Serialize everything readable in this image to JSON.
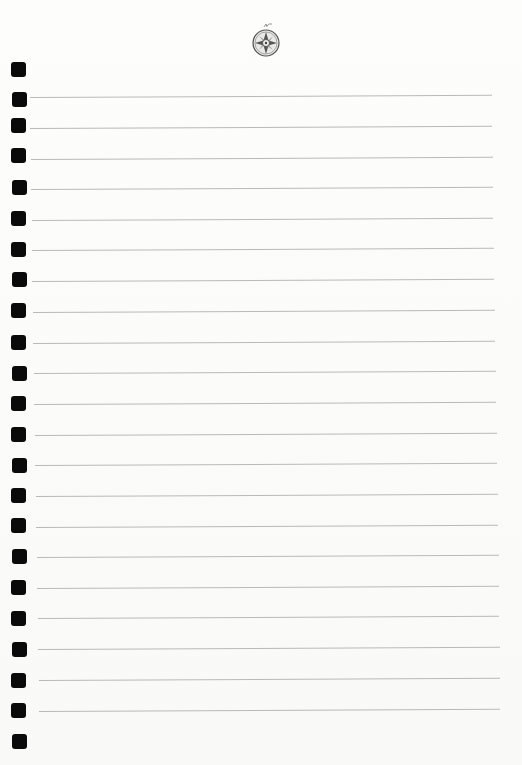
{
  "page": {
    "type": "lined-notebook-page",
    "background_color": "#fbfbfa",
    "rule_color": "#b9b9b6",
    "hole_color": "#0a0a0a",
    "emblem": "compass-rose-icon"
  },
  "holes_y": [
    62,
    92,
    118,
    148,
    180,
    211,
    242,
    272,
    303,
    335,
    366,
    396,
    427,
    458,
    488,
    518,
    549,
    580,
    611,
    642,
    673,
    703,
    734
  ],
  "rules": [
    {
      "y": 97,
      "x1": 30,
      "x2": 492
    },
    {
      "y": 128,
      "x1": 30,
      "x2": 492
    },
    {
      "y": 159,
      "x1": 31,
      "x2": 493
    },
    {
      "y": 189,
      "x1": 31,
      "x2": 493
    },
    {
      "y": 220,
      "x1": 32,
      "x2": 493
    },
    {
      "y": 250,
      "x1": 32,
      "x2": 494
    },
    {
      "y": 281,
      "x1": 32,
      "x2": 494
    },
    {
      "y": 312,
      "x1": 33,
      "x2": 495
    },
    {
      "y": 343,
      "x1": 33,
      "x2": 495
    },
    {
      "y": 373,
      "x1": 34,
      "x2": 496
    },
    {
      "y": 404,
      "x1": 34,
      "x2": 496
    },
    {
      "y": 435,
      "x1": 35,
      "x2": 497
    },
    {
      "y": 465,
      "x1": 35,
      "x2": 497
    },
    {
      "y": 496,
      "x1": 36,
      "x2": 498
    },
    {
      "y": 527,
      "x1": 36,
      "x2": 498
    },
    {
      "y": 557,
      "x1": 37,
      "x2": 499
    },
    {
      "y": 588,
      "x1": 37,
      "x2": 499
    },
    {
      "y": 618,
      "x1": 38,
      "x2": 499
    },
    {
      "y": 649,
      "x1": 38,
      "x2": 500
    },
    {
      "y": 680,
      "x1": 39,
      "x2": 500
    },
    {
      "y": 711,
      "x1": 39,
      "x2": 500
    }
  ]
}
